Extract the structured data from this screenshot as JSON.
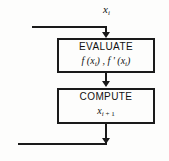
{
  "diagram": {
    "type": "flowchart",
    "input_label": {
      "variable": "x",
      "subscript": "i"
    },
    "boxes": [
      {
        "id": "evaluate",
        "line1": "EVALUATE",
        "formula_parts": {
          "f_open": "f (x",
          "sub1": "i",
          "mid": ") , f ' (x",
          "sub2": "i",
          "close": ")"
        }
      },
      {
        "id": "compute",
        "line1": "COMPUTE",
        "formula_parts": {
          "variable": "x",
          "sub1": "i",
          "suffix": " + 1"
        }
      }
    ],
    "connectors": [
      {
        "id": "top-feedback-horizontal",
        "orientation": "horizontal"
      },
      {
        "id": "top-entry-vertical",
        "orientation": "vertical",
        "arrow": "down"
      },
      {
        "id": "between-boxes-vertical",
        "orientation": "vertical",
        "arrow": "down"
      },
      {
        "id": "bottom-exit-vertical",
        "orientation": "vertical",
        "arrow": "down"
      },
      {
        "id": "bottom-feedback-horizontal",
        "orientation": "horizontal"
      }
    ],
    "colors": {
      "line": "#1a1a1a",
      "text": "#111111",
      "background": "#fdfdfc"
    }
  }
}
